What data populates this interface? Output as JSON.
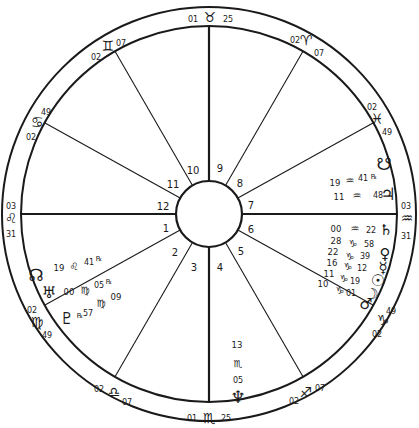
{
  "chart": {
    "center": [
      209,
      214
    ],
    "outer_radius": 207,
    "inner_radius": 188,
    "hub_radius": 33,
    "ink_color": "#1a1a1a",
    "background": "#ffffff"
  },
  "house_numbers": [
    {
      "n": "1",
      "x": 166,
      "y": 232
    },
    {
      "n": "2",
      "x": 175,
      "y": 256
    },
    {
      "n": "3",
      "x": 194,
      "y": 271
    },
    {
      "n": "4",
      "x": 220,
      "y": 271
    },
    {
      "n": "5",
      "x": 241,
      "y": 255
    },
    {
      "n": "6",
      "x": 251,
      "y": 233
    },
    {
      "n": "7",
      "x": 251,
      "y": 209
    },
    {
      "n": "8",
      "x": 240,
      "y": 187
    },
    {
      "n": "9",
      "x": 220,
      "y": 172
    },
    {
      "n": "10",
      "x": 193,
      "y": 174
    },
    {
      "n": "11",
      "x": 173,
      "y": 188
    },
    {
      "n": "12",
      "x": 163,
      "y": 210
    }
  ],
  "cusps": [
    {
      "angle": 90,
      "axis": true,
      "sign": "♉",
      "sign_name": "Taurus",
      "deg": "01",
      "min": "25",
      "sign_pos": [
        210,
        17
      ],
      "deg_pos": [
        193,
        19
      ],
      "min_pos": [
        228,
        19
      ]
    },
    {
      "angle": 120,
      "axis": false,
      "sign": "♊",
      "sign_name": "Gemini",
      "deg": "02",
      "min": "07",
      "sign_pos": [
        108,
        46
      ],
      "deg_pos": [
        96,
        57
      ],
      "min_pos": [
        121,
        43
      ]
    },
    {
      "angle": 151,
      "axis": false,
      "sign": "♋",
      "sign_name": "Cancer",
      "deg": "02",
      "min": "49",
      "sign_pos": [
        37,
        122
      ],
      "deg_pos": [
        31,
        137
      ],
      "min_pos": [
        46,
        112
      ]
    },
    {
      "angle": 180,
      "axis": true,
      "sign": "♌",
      "sign_name": "Leo",
      "deg": "03",
      "min": "31",
      "sign_pos": [
        11,
        218
      ],
      "deg_pos": [
        11,
        206
      ],
      "min_pos": [
        11,
        234
      ]
    },
    {
      "angle": 209,
      "axis": false,
      "sign": "♍",
      "sign_name": "Virgo",
      "deg": "02",
      "min": "49",
      "sign_pos": [
        37,
        322
      ],
      "deg_pos": [
        32,
        310
      ],
      "min_pos": [
        47,
        335
      ]
    },
    {
      "angle": 240,
      "axis": false,
      "sign": "♎",
      "sign_name": "Libra",
      "deg": "02",
      "min": "07",
      "sign_pos": [
        114,
        392
      ],
      "deg_pos": [
        99,
        389
      ],
      "min_pos": [
        127,
        402
      ]
    },
    {
      "angle": 270,
      "axis": true,
      "sign": "♏",
      "sign_name": "Scorpio",
      "deg": "01",
      "min": "25",
      "sign_pos": [
        209,
        418
      ],
      "deg_pos": [
        192,
        418
      ],
      "min_pos": [
        226,
        418
      ]
    },
    {
      "angle": 300,
      "axis": false,
      "sign": "♐",
      "sign_name": "Sagittarius",
      "deg": "02",
      "min": "07",
      "sign_pos": [
        306,
        392
      ],
      "deg_pos": [
        294,
        401
      ],
      "min_pos": [
        320,
        388
      ]
    },
    {
      "angle": 331,
      "axis": false,
      "sign": "♑",
      "sign_name": "Capricorn",
      "deg": "02",
      "min": "49",
      "sign_pos": [
        383,
        320
      ],
      "deg_pos": [
        377,
        334
      ],
      "min_pos": [
        391,
        311
      ]
    },
    {
      "angle": 0,
      "axis": true,
      "sign": "♒",
      "sign_name": "Aquarius",
      "deg": "03",
      "min": "31",
      "sign_pos": [
        407,
        218
      ],
      "deg_pos": [
        406,
        206
      ],
      "min_pos": [
        406,
        236
      ]
    },
    {
      "angle": 29,
      "axis": false,
      "sign": "♓",
      "sign_name": "Pisces",
      "deg": "02",
      "min": "49",
      "sign_pos": [
        377,
        119
      ],
      "deg_pos": [
        372,
        107
      ],
      "min_pos": [
        387,
        132
      ]
    },
    {
      "angle": 60,
      "axis": false,
      "sign": "♈",
      "sign_name": "Aries",
      "deg": "02",
      "min": "07",
      "sign_pos": [
        306,
        40
      ],
      "deg_pos": [
        295,
        40
      ],
      "min_pos": [
        319,
        53
      ]
    }
  ],
  "planets": [
    {
      "name": "South Node",
      "glyph": "☋",
      "pos": [
        384,
        164
      ],
      "size": 17
    },
    {
      "name": "Jupiter",
      "glyph": "♃",
      "pos": [
        388,
        194
      ],
      "size": 17,
      "deg": "11",
      "sign": "♒",
      "min": "48",
      "retro": false,
      "deg_pos": [
        339,
        197
      ],
      "sign_pos": [
        357,
        195
      ],
      "min_pos": [
        378,
        195
      ]
    },
    {
      "name": "Retro South Node label",
      "glyph": "",
      "pos": [
        0,
        0
      ],
      "size": 0,
      "deg": "19",
      "sign": "♒",
      "min": "41",
      "retro": true,
      "deg_pos": [
        335,
        183
      ],
      "sign_pos": [
        350,
        180
      ],
      "min_pos": [
        363,
        178
      ],
      "retro_pos": [
        374,
        176
      ]
    },
    {
      "name": "Saturn",
      "glyph": "♄",
      "pos": [
        386,
        230
      ],
      "size": 15,
      "deg": "00",
      "sign": "♒",
      "min": "22",
      "deg_pos": [
        336,
        229
      ],
      "sign_pos": [
        355,
        228
      ],
      "min_pos": [
        371,
        230
      ]
    },
    {
      "name": "Venus",
      "glyph": "♀",
      "pos": [
        385,
        254
      ],
      "size": 15,
      "deg": "28",
      "sign": "♑",
      "min": "58",
      "deg_pos": [
        336,
        241
      ],
      "sign_pos": [
        353,
        243
      ],
      "min_pos": [
        369,
        244
      ]
    },
    {
      "name": "Mercury",
      "glyph": "☿",
      "pos": [
        383,
        268
      ],
      "size": 15,
      "deg": "22",
      "sign": "♑",
      "min": "39",
      "deg_pos": [
        333,
        252
      ],
      "sign_pos": [
        350,
        256
      ],
      "min_pos": [
        365,
        256
      ]
    },
    {
      "name": "Sun",
      "glyph": "☉",
      "pos": [
        378,
        280
      ],
      "size": 16,
      "deg": "16",
      "sign": "♑",
      "min": "12",
      "deg_pos": [
        332,
        263
      ],
      "sign_pos": [
        348,
        266
      ],
      "min_pos": [
        362,
        268
      ]
    },
    {
      "name": "Moon",
      "glyph": "☽",
      "pos": [
        372,
        294
      ],
      "size": 15,
      "deg": "11",
      "sign": "♑",
      "min": "19",
      "deg_pos": [
        329,
        274
      ],
      "sign_pos": [
        344,
        278
      ],
      "min_pos": [
        355,
        281
      ]
    },
    {
      "name": "Mars",
      "glyph": "♂",
      "pos": [
        366,
        304
      ],
      "size": 15,
      "deg": "10",
      "sign": "♑",
      "min": "01",
      "deg_pos": [
        323,
        284
      ],
      "sign_pos": [
        340,
        290
      ],
      "min_pos": [
        351,
        293
      ]
    },
    {
      "name": "North Node",
      "glyph": "☊",
      "pos": [
        36,
        275
      ],
      "size": 17,
      "deg": "19",
      "sign": "♌",
      "min": "41",
      "retro": true,
      "deg_pos": [
        59,
        268
      ],
      "sign_pos": [
        74,
        266
      ],
      "min_pos": [
        89,
        262
      ],
      "retro_pos": [
        99,
        258
      ]
    },
    {
      "name": "Uranus",
      "glyph": "♅",
      "pos": [
        49,
        292
      ],
      "size": 16,
      "deg": "00",
      "sign": "♍",
      "min": "05",
      "retro": true,
      "deg_pos": [
        69,
        292
      ],
      "sign_pos": [
        85,
        290
      ],
      "min_pos": [
        99,
        285
      ],
      "retro_pos": [
        109,
        281
      ]
    },
    {
      "name": "Pluto",
      "glyph": "♇",
      "pos": [
        67,
        318
      ],
      "size": 16,
      "deg": "09",
      "sign": "♍",
      "min": "57",
      "retro": true,
      "deg_pos": [
        116,
        297
      ],
      "sign_pos": [
        101,
        303
      ],
      "min_pos": [
        88,
        313
      ],
      "retro_pos": [
        80,
        315
      ]
    },
    {
      "name": "Neptune",
      "glyph": "♆",
      "pos": [
        238,
        397
      ],
      "size": 17,
      "deg": "13",
      "sign": "♏",
      "min": "05",
      "deg_pos": [
        237,
        345
      ],
      "sign_pos": [
        238,
        363
      ],
      "min_pos": [
        238,
        380
      ]
    }
  ],
  "retro_glyph": "℞"
}
